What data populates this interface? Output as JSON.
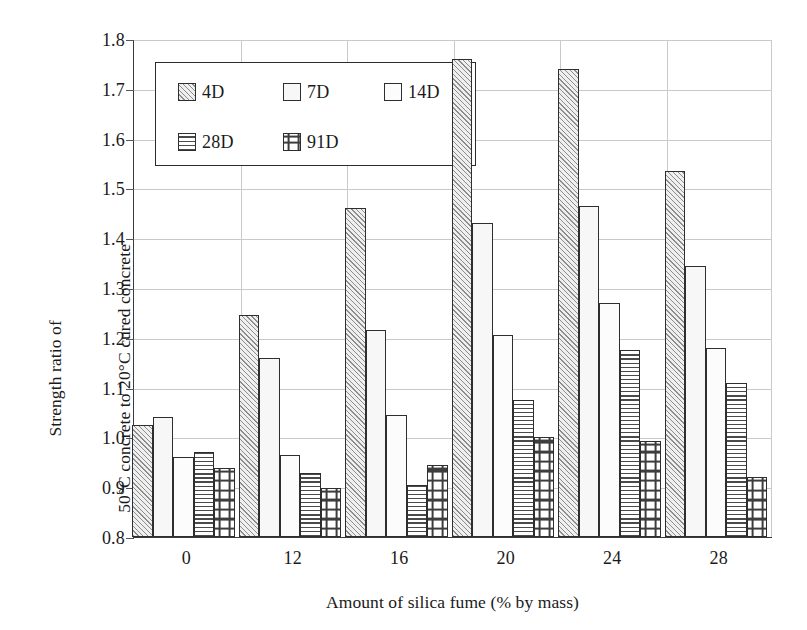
{
  "chart_data": {
    "type": "bar",
    "title": "",
    "xlabel": "Amount of silica fume (% by mass)",
    "ylabel": "Strength ratio of 50°C concrete to 20°C cured concrete",
    "ylabel_line1": "Strength ratio of",
    "ylabel_line2": "50°C concrete to 20°C cured concrete",
    "categories": [
      "0",
      "12",
      "16",
      "20",
      "24",
      "28"
    ],
    "ylim": [
      0.8,
      1.8
    ],
    "yticks": [
      "0.8",
      "0.9",
      "1.0",
      "1.1",
      "1.2",
      "1.3",
      "1.4",
      "1.5",
      "1.6",
      "1.7",
      "1.8"
    ],
    "ytick_values": [
      0.8,
      0.9,
      1.0,
      1.1,
      1.2,
      1.3,
      1.4,
      1.5,
      1.6,
      1.7,
      1.8
    ],
    "grid": true,
    "legend_position": "upper-left-inside",
    "series": [
      {
        "name": "4D",
        "pattern": "diagonal-hatch",
        "values": [
          1.025,
          1.245,
          1.46,
          1.76,
          1.74,
          1.535
        ]
      },
      {
        "name": "7D",
        "pattern": "fine-dots",
        "values": [
          1.04,
          1.16,
          1.215,
          1.43,
          1.465,
          1.345
        ]
      },
      {
        "name": "14D",
        "pattern": "plain-white",
        "values": [
          0.96,
          0.965,
          1.045,
          1.205,
          1.27,
          1.18
        ]
      },
      {
        "name": "28D",
        "pattern": "horizontal-lines",
        "values": [
          0.97,
          0.928,
          0.905,
          1.075,
          1.175,
          1.11
        ]
      },
      {
        "name": "91D",
        "pattern": "cross-grid",
        "values": [
          0.938,
          0.898,
          0.945,
          1.0,
          0.992,
          0.92
        ]
      }
    ]
  },
  "legend": {
    "items": [
      {
        "label": "4D",
        "pattern": "pat-4d"
      },
      {
        "label": "7D",
        "pattern": "pat-7d"
      },
      {
        "label": "14D",
        "pattern": "pat-14d"
      },
      {
        "label": "28D",
        "pattern": "pat-28d"
      },
      {
        "label": "91D",
        "pattern": "pat-91d"
      }
    ]
  },
  "colors": {
    "axis": "#3a3a3a",
    "grid": "#c9c9c9",
    "bar_edge": "#2e2e2e",
    "text": "#1a1a1a",
    "background": "#ffffff"
  }
}
